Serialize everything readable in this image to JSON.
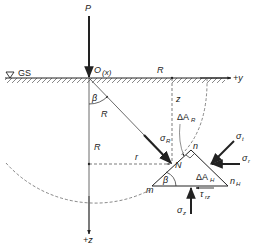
{
  "diagram": {
    "labels": {
      "load": "P",
      "origin": "O",
      "origin_axis": "(x)",
      "ground_surface": "GS",
      "y_axis": "+y",
      "z_axis": "+z",
      "radius_top": "R",
      "radius_diag": "R",
      "radius_vertical": "R",
      "depth": "z",
      "horizontal_offset": "r",
      "angle_top": "β",
      "angle_bottom": "β",
      "area_radial": "ΔA",
      "area_radial_sub": "R",
      "area_horizontal": "ΔA",
      "area_horizontal_sub": "H",
      "point": "N",
      "vertex_m": "m",
      "vertex_n": "n",
      "vertex_nh": "n",
      "vertex_nh_sub": "H",
      "sigma_R": "σ",
      "sigma_R_sub": "R",
      "sigma_t": "σ",
      "sigma_t_sub": "t",
      "sigma_r": "σ",
      "sigma_r_sub": "r",
      "sigma_z": "σ",
      "sigma_z_sub": "z",
      "tau": "τ",
      "tau_sub": "rz"
    },
    "colors": {
      "ink": "#222222",
      "background": "#ffffff"
    }
  }
}
